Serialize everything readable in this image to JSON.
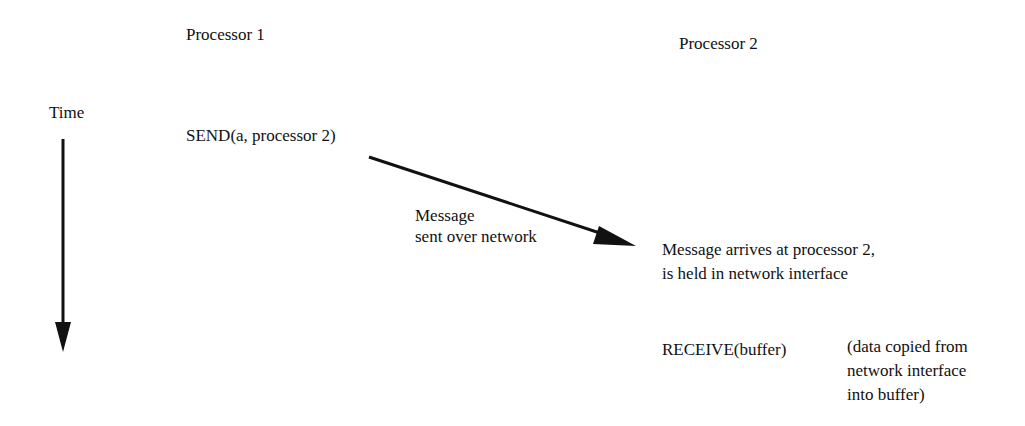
{
  "diagram": {
    "columns": {
      "processor1": "Processor 1",
      "processor2": "Processor 2"
    },
    "time_label": "Time",
    "events": {
      "send": "SEND(a, processor 2)",
      "message_line1": "Message",
      "message_line2": "sent over network",
      "arrive_line1": "Message arrives at processor 2,",
      "arrive_line2": "is held in network interface",
      "receive": "RECEIVE(buffer)",
      "note_line1": "(data copied from",
      "note_line2": "network interface",
      "note_line3": "into buffer)"
    },
    "colors": {
      "ink": "#111111",
      "background": "#ffffff"
    }
  }
}
